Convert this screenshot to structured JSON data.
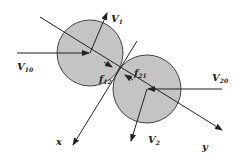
{
  "diagram": {
    "type": "collision-two-spheres",
    "colors": {
      "sphere_fill": "#c4c4c4",
      "sphere_stroke": "#444444",
      "line": "#222222",
      "background": "#ffffff"
    },
    "spheres": [
      {
        "id": "sphere-1",
        "cx": 90,
        "cy": 53,
        "r": 33
      },
      {
        "id": "sphere-2",
        "cx": 147,
        "cy": 89,
        "r": 34
      }
    ],
    "labels": {
      "v1": {
        "main": "V",
        "sub": "1"
      },
      "v10": {
        "main": "V",
        "sub": "10"
      },
      "v2": {
        "main": "V",
        "sub": "2"
      },
      "v20": {
        "main": "V",
        "sub": "20"
      },
      "f12": {
        "main": "f",
        "sub": "12"
      },
      "f21": {
        "main": "f",
        "sub": "21"
      },
      "x_axis": "x",
      "y_axis": "y"
    }
  }
}
